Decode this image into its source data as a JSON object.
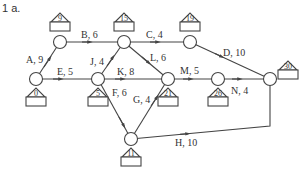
{
  "title": "1 a.",
  "nodes": [
    {
      "id": "n0",
      "value": "0",
      "x": 36,
      "y": 79,
      "box": "below"
    },
    {
      "id": "n9",
      "value": "9",
      "x": 60,
      "y": 42,
      "box": "above"
    },
    {
      "id": "n15",
      "value": "15",
      "x": 124,
      "y": 42,
      "box": "above"
    },
    {
      "id": "n19",
      "value": "19",
      "x": 190,
      "y": 42,
      "box": "above"
    },
    {
      "id": "n5",
      "value": "5",
      "x": 98,
      "y": 79,
      "box": "below"
    },
    {
      "id": "n21",
      "value": "21",
      "x": 168,
      "y": 79,
      "box": "below"
    },
    {
      "id": "n26",
      "value": "26",
      "x": 218,
      "y": 79,
      "box": "below"
    },
    {
      "id": "n30",
      "value": "30",
      "x": 270,
      "y": 79,
      "box": "right"
    },
    {
      "id": "n11",
      "value": "11",
      "x": 131,
      "y": 139,
      "box": "below"
    }
  ],
  "edges": [
    {
      "label": "A, 9",
      "from": "n0",
      "to": "n9"
    },
    {
      "label": "B, 6",
      "from": "n9",
      "to": "n15"
    },
    {
      "label": "C, 4",
      "from": "n15",
      "to": "n19"
    },
    {
      "label": "D, 10",
      "from": "n19",
      "to": "n30"
    },
    {
      "label": "E, 5",
      "from": "n0",
      "to": "n5"
    },
    {
      "label": "J, 4",
      "from": "n5",
      "to": "n15"
    },
    {
      "label": "K, 8",
      "from": "n5",
      "to": "n21"
    },
    {
      "label": "L, 6",
      "from": "n15",
      "to": "n21"
    },
    {
      "label": "M, 5",
      "from": "n21",
      "to": "n26"
    },
    {
      "label": "N, 4",
      "from": "n26",
      "to": "n30"
    },
    {
      "label": "F, 6",
      "from": "n5",
      "to": "n11"
    },
    {
      "label": "G, 4",
      "from": "n11",
      "to": "n21"
    },
    {
      "label": "H, 10",
      "from": "n11",
      "to": "n30"
    }
  ],
  "labels": {
    "A": "A, 9",
    "B": "B, 6",
    "C": "C, 4",
    "D": "D, 10",
    "E": "E, 5",
    "J": "J, 4",
    "K": "K, 8",
    "L": "L, 6",
    "M": "M, 5",
    "N": "N, 4",
    "F": "F, 6",
    "G": "G, 4",
    "H": "H, 10"
  },
  "values": {
    "n0": "0",
    "n9": "9",
    "n15": "15",
    "n19": "19",
    "n5": "5",
    "n21": "21",
    "n26": "26",
    "n30": "30",
    "n11": "11"
  }
}
